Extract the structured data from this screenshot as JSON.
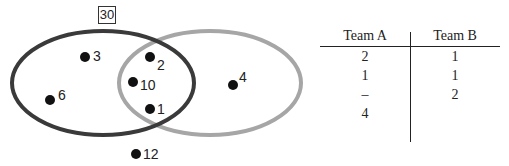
{
  "venn": {
    "universe_label": "30",
    "sets": [
      {
        "name": "dark-set",
        "color": "#3a3a3a"
      },
      {
        "name": "gray-set",
        "color": "#a6a6a6"
      }
    ],
    "points": [
      {
        "label": "3",
        "region": "dark only"
      },
      {
        "label": "6",
        "region": "dark only"
      },
      {
        "label": "2",
        "region": "both"
      },
      {
        "label": "10",
        "region": "both"
      },
      {
        "label": "1",
        "region": "both"
      },
      {
        "label": "4",
        "region": "gray only"
      },
      {
        "label": "12",
        "region": "outside"
      }
    ]
  },
  "table": {
    "headers": [
      "Team A",
      "Team B"
    ],
    "rows": [
      [
        "2",
        "1"
      ],
      [
        "1",
        "1"
      ],
      [
        "–",
        "2"
      ],
      [
        "4",
        ""
      ]
    ]
  }
}
